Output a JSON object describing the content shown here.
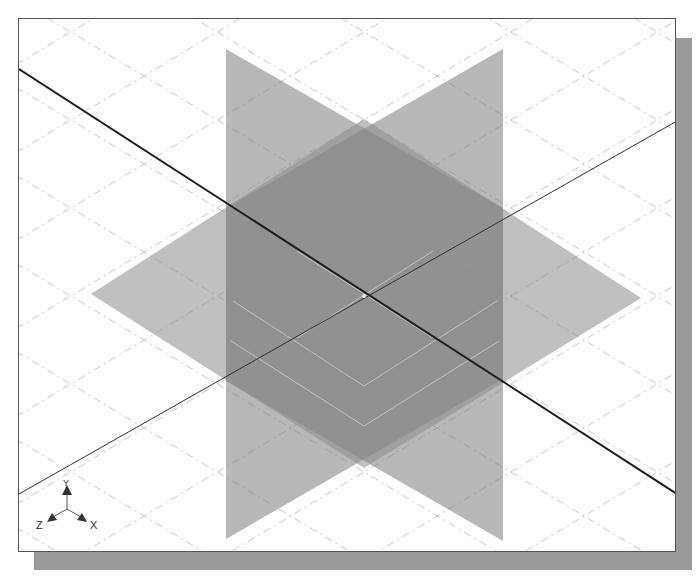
{
  "scene": {
    "description": "Isometric view of three default datum planes (XY, YZ, XZ) intersecting at origin with grid",
    "planes": [
      {
        "name": "XY-plane",
        "color": "#8a8a8a"
      },
      {
        "name": "YZ-plane",
        "color": "#8a8a8a"
      },
      {
        "name": "XZ-plane",
        "color": "#9a9a9a"
      }
    ],
    "axes_lines": [
      {
        "name": "x-axis-line",
        "color": "#222222"
      },
      {
        "name": "z-axis-line",
        "color": "#333333"
      }
    ],
    "grid_color": "#c8c8c8"
  },
  "triad": {
    "y_label": "Y",
    "z_label": "Z",
    "x_label": "X"
  }
}
